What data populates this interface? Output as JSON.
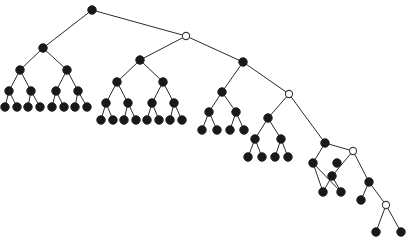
{
  "figure": {
    "background_color": "#ffffff",
    "width": 410,
    "height": 244,
    "edge_color": "#2b2b2b",
    "solid_node_color": "#191919",
    "hollow_node_fill": "#ffffff",
    "hollow_node_stroke": "#3a3a3a",
    "solid_node_radius": 4.2,
    "hollow_node_radius": 3.6,
    "edge_width": 1
  },
  "chart_data": {
    "type": "diagram",
    "xlabel": "",
    "ylabel": "",
    "xlim": [
      0,
      410
    ],
    "ylim": [
      0,
      244
    ],
    "grid": false,
    "legend": "none",
    "node_count": 66,
    "edge_count": 65,
    "hollow_node_count": 4,
    "solid_node_count": 62,
    "nodes": [
      {
        "id": "root",
        "x": 92,
        "y": 10,
        "kind": "solid"
      },
      {
        "id": "s1",
        "x": 186,
        "y": 36,
        "kind": "hollow"
      },
      {
        "id": "s2",
        "x": 289,
        "y": 94,
        "kind": "hollow"
      },
      {
        "id": "s3",
        "x": 353,
        "y": 151,
        "kind": "hollow"
      },
      {
        "id": "s4",
        "x": 386,
        "y": 205,
        "kind": "hollow"
      },
      {
        "id": "a0",
        "x": 43,
        "y": 48,
        "kind": "solid"
      },
      {
        "id": "a1",
        "x": 20,
        "y": 70,
        "kind": "solid"
      },
      {
        "id": "a2",
        "x": 67,
        "y": 70,
        "kind": "solid"
      },
      {
        "id": "a3",
        "x": 9,
        "y": 91,
        "kind": "solid"
      },
      {
        "id": "a4",
        "x": 31,
        "y": 91,
        "kind": "solid"
      },
      {
        "id": "a5",
        "x": 56,
        "y": 91,
        "kind": "solid"
      },
      {
        "id": "a6",
        "x": 78,
        "y": 91,
        "kind": "solid"
      },
      {
        "id": "a7",
        "x": 5,
        "y": 107,
        "kind": "solid"
      },
      {
        "id": "a8",
        "x": 17,
        "y": 107,
        "kind": "solid"
      },
      {
        "id": "a9",
        "x": 28,
        "y": 107,
        "kind": "solid"
      },
      {
        "id": "a10",
        "x": 40,
        "y": 107,
        "kind": "solid"
      },
      {
        "id": "a11",
        "x": 52,
        "y": 107,
        "kind": "solid"
      },
      {
        "id": "a12",
        "x": 64,
        "y": 107,
        "kind": "solid"
      },
      {
        "id": "a13",
        "x": 75,
        "y": 107,
        "kind": "solid"
      },
      {
        "id": "a14",
        "x": 87,
        "y": 107,
        "kind": "solid"
      },
      {
        "id": "b0",
        "x": 140,
        "y": 60,
        "kind": "solid"
      },
      {
        "id": "b1",
        "x": 117,
        "y": 82,
        "kind": "solid"
      },
      {
        "id": "b2",
        "x": 163,
        "y": 82,
        "kind": "solid"
      },
      {
        "id": "b3",
        "x": 106,
        "y": 103,
        "kind": "solid"
      },
      {
        "id": "b4",
        "x": 128,
        "y": 103,
        "kind": "solid"
      },
      {
        "id": "b5",
        "x": 152,
        "y": 103,
        "kind": "solid"
      },
      {
        "id": "b6",
        "x": 174,
        "y": 103,
        "kind": "solid"
      },
      {
        "id": "b7",
        "x": 101,
        "y": 120,
        "kind": "solid"
      },
      {
        "id": "b8",
        "x": 113,
        "y": 120,
        "kind": "solid"
      },
      {
        "id": "b9",
        "x": 124,
        "y": 120,
        "kind": "solid"
      },
      {
        "id": "b10",
        "x": 136,
        "y": 120,
        "kind": "solid"
      },
      {
        "id": "b11",
        "x": 147,
        "y": 120,
        "kind": "solid"
      },
      {
        "id": "b12",
        "x": 159,
        "y": 120,
        "kind": "solid"
      },
      {
        "id": "b13",
        "x": 170,
        "y": 120,
        "kind": "solid"
      },
      {
        "id": "b14",
        "x": 182,
        "y": 120,
        "kind": "solid"
      },
      {
        "id": "c0",
        "x": 243,
        "y": 62,
        "kind": "solid"
      },
      {
        "id": "c1",
        "x": 222,
        "y": 92,
        "kind": "solid"
      },
      {
        "id": "c2",
        "x": 209,
        "y": 112,
        "kind": "solid"
      },
      {
        "id": "c3",
        "x": 236,
        "y": 112,
        "kind": "solid"
      },
      {
        "id": "c4",
        "x": 202,
        "y": 130,
        "kind": "solid"
      },
      {
        "id": "c5",
        "x": 217,
        "y": 130,
        "kind": "solid"
      },
      {
        "id": "c6",
        "x": 230,
        "y": 130,
        "kind": "solid"
      },
      {
        "id": "c7",
        "x": 244,
        "y": 130,
        "kind": "solid"
      },
      {
        "id": "d0",
        "x": 268,
        "y": 118,
        "kind": "solid"
      },
      {
        "id": "d1",
        "x": 255,
        "y": 139,
        "kind": "solid"
      },
      {
        "id": "d2",
        "x": 281,
        "y": 139,
        "kind": "solid"
      },
      {
        "id": "d3",
        "x": 248,
        "y": 157,
        "kind": "solid"
      },
      {
        "id": "d4",
        "x": 262,
        "y": 157,
        "kind": "solid"
      },
      {
        "id": "d5",
        "x": 275,
        "y": 157,
        "kind": "solid"
      },
      {
        "id": "d6",
        "x": 288,
        "y": 157,
        "kind": "solid"
      },
      {
        "id": "e0",
        "x": 325,
        "y": 143,
        "kind": "solid"
      },
      {
        "id": "e1",
        "x": 313,
        "y": 163,
        "kind": "solid"
      },
      {
        "id": "e2",
        "x": 337,
        "y": 163,
        "kind": "solid"
      },
      {
        "id": "f0",
        "x": 332,
        "y": 176,
        "kind": "solid"
      },
      {
        "id": "f1",
        "x": 323,
        "y": 192,
        "kind": "solid"
      },
      {
        "id": "f2",
        "x": 341,
        "y": 192,
        "kind": "solid"
      },
      {
        "id": "g0",
        "x": 369,
        "y": 182,
        "kind": "solid"
      },
      {
        "id": "g1",
        "x": 361,
        "y": 200,
        "kind": "solid"
      },
      {
        "id": "h0",
        "x": 376,
        "y": 232,
        "kind": "solid"
      },
      {
        "id": "h1",
        "x": 401,
        "y": 232,
        "kind": "solid"
      }
    ],
    "edges": [
      [
        "root",
        "a0"
      ],
      [
        "root",
        "s1"
      ],
      [
        "a0",
        "a1"
      ],
      [
        "a0",
        "a2"
      ],
      [
        "a1",
        "a3"
      ],
      [
        "a1",
        "a4"
      ],
      [
        "a2",
        "a5"
      ],
      [
        "a2",
        "a6"
      ],
      [
        "a3",
        "a7"
      ],
      [
        "a3",
        "a8"
      ],
      [
        "a4",
        "a9"
      ],
      [
        "a4",
        "a10"
      ],
      [
        "a5",
        "a11"
      ],
      [
        "a5",
        "a12"
      ],
      [
        "a6",
        "a13"
      ],
      [
        "a6",
        "a14"
      ],
      [
        "s1",
        "b0"
      ],
      [
        "s1",
        "c0"
      ],
      [
        "b0",
        "b1"
      ],
      [
        "b0",
        "b2"
      ],
      [
        "b1",
        "b3"
      ],
      [
        "b1",
        "b4"
      ],
      [
        "b2",
        "b5"
      ],
      [
        "b2",
        "b6"
      ],
      [
        "b3",
        "b7"
      ],
      [
        "b3",
        "b8"
      ],
      [
        "b4",
        "b9"
      ],
      [
        "b4",
        "b10"
      ],
      [
        "b5",
        "b11"
      ],
      [
        "b5",
        "b12"
      ],
      [
        "b6",
        "b13"
      ],
      [
        "b6",
        "b14"
      ],
      [
        "c0",
        "c1"
      ],
      [
        "c0",
        "s2"
      ],
      [
        "c1",
        "c2"
      ],
      [
        "c1",
        "c3"
      ],
      [
        "c2",
        "c4"
      ],
      [
        "c2",
        "c5"
      ],
      [
        "c3",
        "c6"
      ],
      [
        "c3",
        "c7"
      ],
      [
        "s2",
        "d0"
      ],
      [
        "s2",
        "e0"
      ],
      [
        "d0",
        "d1"
      ],
      [
        "d0",
        "d2"
      ],
      [
        "d1",
        "d3"
      ],
      [
        "d1",
        "d4"
      ],
      [
        "d2",
        "d5"
      ],
      [
        "d2",
        "d6"
      ],
      [
        "e0",
        "e1"
      ],
      [
        "e0",
        "s3"
      ],
      [
        "e1",
        "f1"
      ],
      [
        "e1",
        "f2"
      ],
      [
        "s3",
        "f0"
      ],
      [
        "s3",
        "g0"
      ],
      [
        "f0",
        "f1"
      ],
      [
        "f0",
        "f2"
      ],
      [
        "g0",
        "g1"
      ],
      [
        "g0",
        "s4"
      ],
      [
        "s4",
        "h0"
      ],
      [
        "s4",
        "h1"
      ]
    ]
  }
}
